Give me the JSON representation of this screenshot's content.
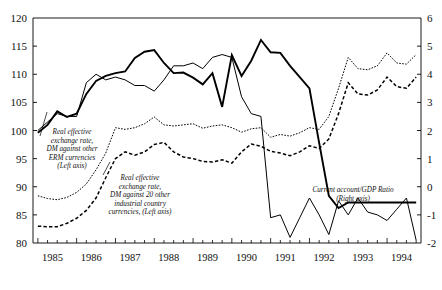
{
  "chart_data": {
    "type": "line",
    "title": "",
    "xlabel": "",
    "ylabel": "",
    "y_left_label": "",
    "y_right_label": "",
    "ylim": [
      80,
      120
    ],
    "ylim_right": [
      -2,
      6
    ],
    "y_left_ticks": [
      "80",
      "85",
      "90",
      "95",
      "100",
      "105",
      "110",
      "115",
      "120"
    ],
    "y_right_ticks": [
      "-2",
      "-1",
      "0",
      "1",
      "2",
      "3",
      "4",
      "5",
      "6"
    ],
    "x_tick_labels": [
      "1985",
      "1986",
      "1987",
      "1988",
      "1989",
      "1990",
      "1991",
      "1992",
      "1993",
      "1994"
    ],
    "x_minor_ticks": "quarterly",
    "grid": false,
    "legend_position": "inline-annotations",
    "x": [
      "1985Q1",
      "1985Q2",
      "1985Q3",
      "1985Q4",
      "1986Q1",
      "1986Q2",
      "1986Q3",
      "1986Q4",
      "1987Q1",
      "1987Q2",
      "1987Q3",
      "1987Q4",
      "1988Q1",
      "1988Q2",
      "1988Q3",
      "1988Q4",
      "1989Q1",
      "1989Q2",
      "1989Q3",
      "1989Q4",
      "1990Q1",
      "1990Q2",
      "1990Q3",
      "1990Q4",
      "1991Q1",
      "1991Q2",
      "1991Q3",
      "1991Q4",
      "1992Q1",
      "1992Q2",
      "1992Q3",
      "1992Q4",
      "1993Q1",
      "1993Q2",
      "1993Q3",
      "1993Q4",
      "1994Q1",
      "1994Q2",
      "1994Q3",
      "1994Q4"
    ],
    "series": [
      {
        "name": "Real effective exchange rate, DM against other ERM currencies (Left axis)",
        "axis": "left",
        "style": "solid-thick",
        "color": "#000000",
        "values": [
          99.6,
          101.0,
          103.4,
          102.4,
          103.0,
          106.5,
          108.8,
          109.7,
          110.2,
          110.5,
          112.9,
          114.0,
          114.3,
          112.0,
          110.2,
          110.3,
          109.4,
          108.2,
          110.2,
          104.2,
          113.4,
          109.7,
          112.4,
          116.1,
          113.9,
          113.8,
          111.5,
          109.5,
          107.5,
          97.8,
          88.4,
          86.2,
          87.2,
          87.2,
          87.2,
          87.2,
          87.2,
          87.2,
          87.2,
          87.2
        ]
      },
      {
        "name": "Real effective exchange rate, DM against 20 other industrial country currencies, (Left axis)",
        "axis": "left",
        "style": "dotted-thin",
        "color": "#000000",
        "values": [
          88.4,
          87.9,
          87.7,
          88.1,
          89.0,
          90.5,
          93.0,
          96.0,
          100.5,
          100.2,
          100.5,
          101.2,
          102.4,
          101.0,
          100.8,
          101.0,
          101.2,
          100.4,
          100.8,
          101.0,
          100.5,
          99.7,
          100.3,
          100.5,
          98.8,
          99.3,
          99.0,
          99.6,
          100.5,
          100.2,
          102.5,
          107.5,
          113.0,
          111.0,
          110.8,
          111.5,
          113.8,
          112.0,
          111.8,
          113.5
        ]
      },
      {
        "name": "Real effective exchange rate, DM against 20 other industrial country currencies (dashed)",
        "axis": "left",
        "style": "dashed",
        "color": "#000000",
        "values": [
          83.0,
          82.9,
          82.9,
          83.5,
          84.4,
          85.8,
          88.0,
          91.6,
          95.0,
          96.2,
          95.6,
          96.2,
          97.5,
          97.9,
          96.2,
          95.3,
          95.0,
          94.5,
          94.4,
          94.8,
          94.2,
          96.2,
          97.6,
          97.2,
          96.3,
          96.0,
          95.5,
          96.2,
          97.3,
          96.8,
          98.5,
          103.0,
          108.5,
          106.5,
          106.3,
          107.2,
          109.5,
          107.8,
          107.5,
          109.5
        ]
      },
      {
        "name": "Current account/GDP Ratio (Right axis)",
        "axis": "right",
        "style": "solid-thin",
        "color": "#000000",
        "values": [
          2.0,
          2.3,
          2.6,
          2.5,
          2.5,
          3.7,
          4.0,
          3.8,
          3.9,
          3.8,
          3.6,
          3.6,
          3.4,
          3.8,
          4.3,
          4.3,
          4.4,
          4.2,
          4.6,
          4.7,
          4.6,
          3.2,
          2.6,
          2.5,
          -1.1,
          -1.0,
          -1.8,
          -1.1,
          -0.4,
          -1.0,
          -1.7,
          -0.5,
          -1.0,
          -0.4,
          -0.9,
          -1.0,
          -1.2,
          -0.8,
          -0.4,
          -1.9
        ]
      }
    ],
    "annotations": [
      {
        "id": "legend-erm",
        "lines": [
          "Real effective",
          "exchange rate,",
          "DM against other",
          "ERM currencies",
          "(Left axis)"
        ]
      },
      {
        "id": "legend-industrial",
        "lines": [
          "Real effective",
          "exchange rate,",
          "DM against 20 other",
          "industrial country",
          "currencies, (Left axis)"
        ]
      },
      {
        "id": "legend-current-account",
        "lines": [
          "Current account/GDP Ratio",
          "(Right axis)"
        ]
      }
    ]
  }
}
